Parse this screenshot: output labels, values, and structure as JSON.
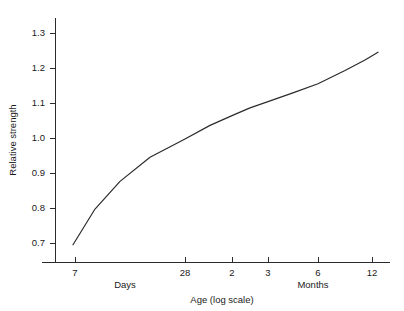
{
  "chart_data": {
    "type": "line",
    "title": "",
    "subtitle": "",
    "xlabel": "Age (log scale)",
    "ylabel": "Relative strength",
    "grid": false,
    "legend": null,
    "x_scale": "log",
    "xlim": [
      5.6,
      14.6
    ],
    "ylim": [
      0.66,
      1.33
    ],
    "ytick_labels": [
      "0.7",
      "0.8",
      "0.9",
      "1.0",
      "1.1",
      "1.2",
      "1.3"
    ],
    "ytick_values": [
      0.7,
      0.8,
      0.9,
      1.0,
      1.1,
      1.2,
      1.3
    ],
    "xtick_labels": [
      "7",
      "28",
      "2",
      "3",
      "6",
      "12"
    ],
    "xtick_group_labels": [
      "Days",
      "Months"
    ],
    "xtick_units": [
      "days",
      "days",
      "months",
      "months",
      "months",
      "months"
    ],
    "series": [
      {
        "name": "Relative strength vs age",
        "x_labels": [
          "7 days",
          "14 days",
          "28 days",
          "2 months",
          "3 months",
          "6 months",
          "12 months"
        ],
        "points": [
          {
            "x_px": 73,
            "y": 0.695
          },
          {
            "x_px": 95,
            "y": 0.797
          },
          {
            "x_px": 120,
            "y": 0.876
          },
          {
            "x_px": 150,
            "y": 0.945
          },
          {
            "x_px": 185,
            "y": 0.997
          },
          {
            "x_px": 210,
            "y": 1.036
          },
          {
            "x_px": 232,
            "y": 1.064
          },
          {
            "x_px": 250,
            "y": 1.086
          },
          {
            "x_px": 268,
            "y": 1.104
          },
          {
            "x_px": 295,
            "y": 1.131
          },
          {
            "x_px": 318,
            "y": 1.155
          },
          {
            "x_px": 345,
            "y": 1.193
          },
          {
            "x_px": 365,
            "y": 1.223
          },
          {
            "x_px": 378,
            "y": 1.245
          }
        ]
      }
    ],
    "axis_geometry": {
      "y_axis_x": 55,
      "y_axis_top": 18,
      "y_axis_bottom": 262,
      "x_axis_y": 262,
      "x_axis_left": 42,
      "x_axis_right": 390,
      "ytick_pixels": [
        243,
        208,
        173,
        138,
        103,
        68,
        33
      ],
      "xtick_pixels": [
        75,
        185,
        232,
        268,
        318,
        372
      ],
      "group_label_pixels": [
        125,
        313
      ]
    },
    "colors": {
      "background": "#ffffff",
      "axis": "#2b2b2b",
      "curve": "#2b2b2b",
      "text": "#1a1a1a"
    }
  }
}
